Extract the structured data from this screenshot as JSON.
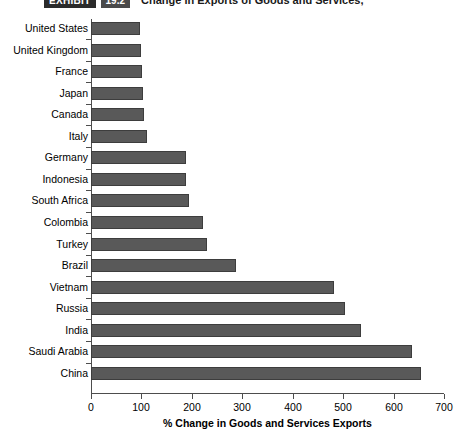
{
  "header": {
    "badge": "EXHIBIT",
    "number": "19.2",
    "title": "Change in Exports of Goods and Services,"
  },
  "chart_data": {
    "type": "bar",
    "orientation": "horizontal",
    "title": "Change in Exports of Goods and Services,",
    "xlabel": "% Change in Goods and Services Exports",
    "ylabel": "",
    "xlim": [
      0,
      700
    ],
    "xticks": [
      0,
      100,
      200,
      300,
      400,
      500,
      600,
      700
    ],
    "grid": false,
    "legend": false,
    "bar_color": "#595959",
    "bar_edge_color": "#3d3d3d",
    "categories": [
      "United States",
      "United Kingdom",
      "France",
      "Japan",
      "Canada",
      "Italy",
      "Germany",
      "Indonesia",
      "South Africa",
      "Colombia",
      "Turkey",
      "Brazil",
      "Vietnam",
      "Russia",
      "India",
      "Saudi Arabia",
      "China"
    ],
    "values": [
      98,
      100,
      101,
      104,
      106,
      111,
      188,
      188,
      194,
      222,
      230,
      288,
      482,
      503,
      535,
      637,
      655
    ]
  }
}
